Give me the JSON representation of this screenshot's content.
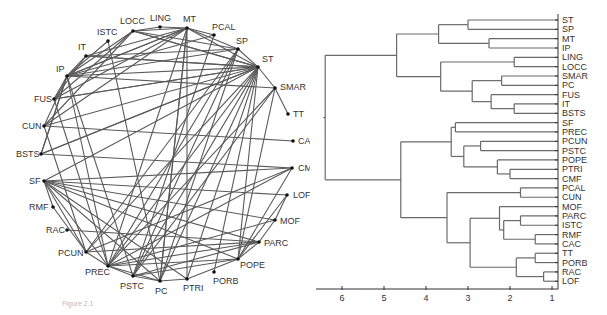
{
  "figure": {
    "caption": "Figure 2.1"
  },
  "network": {
    "nodes": [
      {
        "id": "LOCC",
        "x": 133,
        "y": 31,
        "lx": 120,
        "ly": 24
      },
      {
        "id": "LING",
        "x": 160,
        "y": 27,
        "lx": 150,
        "ly": 21
      },
      {
        "id": "MT",
        "x": 187,
        "y": 28,
        "lx": 183,
        "ly": 22
      },
      {
        "id": "PCAL",
        "x": 214,
        "y": 35,
        "lx": 212,
        "ly": 30
      },
      {
        "id": "ISTC",
        "x": 108,
        "y": 41,
        "lx": 97,
        "ly": 35
      },
      {
        "id": "IT",
        "x": 86,
        "y": 56,
        "lx": 78,
        "ly": 50
      },
      {
        "id": "SP",
        "x": 238,
        "y": 49,
        "lx": 236,
        "ly": 44
      },
      {
        "id": "ST",
        "x": 258,
        "y": 67,
        "lx": 262,
        "ly": 62
      },
      {
        "id": "IP",
        "x": 67,
        "y": 76,
        "lx": 56,
        "ly": 72
      },
      {
        "id": "SMAR",
        "x": 275,
        "y": 88,
        "lx": 280,
        "ly": 90
      },
      {
        "id": "FUS",
        "x": 54,
        "y": 99,
        "lx": 34,
        "ly": 102
      },
      {
        "id": "TT",
        "x": 288,
        "y": 114,
        "lx": 293,
        "ly": 117
      },
      {
        "id": "CUN",
        "x": 44,
        "y": 126,
        "lx": 22,
        "ly": 129
      },
      {
        "id": "CAC",
        "x": 293,
        "y": 141,
        "lx": 298,
        "ly": 144
      },
      {
        "id": "BSTS",
        "x": 41,
        "y": 154,
        "lx": 16,
        "ly": 157
      },
      {
        "id": "CMF",
        "x": 292,
        "y": 168,
        "lx": 298,
        "ly": 171
      },
      {
        "id": "SF",
        "x": 44,
        "y": 181,
        "lx": 29,
        "ly": 184
      },
      {
        "id": "LOF",
        "x": 287,
        "y": 195,
        "lx": 293,
        "ly": 198
      },
      {
        "id": "RMF",
        "x": 53,
        "y": 207,
        "lx": 29,
        "ly": 210
      },
      {
        "id": "MOF",
        "x": 275,
        "y": 220,
        "lx": 280,
        "ly": 224
      },
      {
        "id": "RAC",
        "x": 67,
        "y": 230,
        "lx": 46,
        "ly": 233
      },
      {
        "id": "PARC",
        "x": 259,
        "y": 242,
        "lx": 264,
        "ly": 246
      },
      {
        "id": "PCUN",
        "x": 86,
        "y": 252,
        "lx": 58,
        "ly": 256
      },
      {
        "id": "POPE",
        "x": 238,
        "y": 259,
        "lx": 240,
        "ly": 268
      },
      {
        "id": "PREC",
        "x": 108,
        "y": 266,
        "lx": 85,
        "ly": 275
      },
      {
        "id": "PORB",
        "x": 214,
        "y": 272,
        "lx": 213,
        "ly": 284
      },
      {
        "id": "PSTC",
        "x": 133,
        "y": 276,
        "lx": 120,
        "ly": 289
      },
      {
        "id": "PTRI",
        "x": 187,
        "y": 279,
        "lx": 183,
        "ly": 291
      },
      {
        "id": "PC",
        "x": 160,
        "y": 281,
        "lx": 155,
        "ly": 294
      }
    ],
    "edges": [
      [
        "LOCC",
        "LING"
      ],
      [
        "LOCC",
        "MT"
      ],
      [
        "LOCC",
        "SP"
      ],
      [
        "LOCC",
        "ST"
      ],
      [
        "LING",
        "MT"
      ],
      [
        "MT",
        "PCAL"
      ],
      [
        "MT",
        "SP"
      ],
      [
        "MT",
        "ST"
      ],
      [
        "MT",
        "IP"
      ],
      [
        "MT",
        "IT"
      ],
      [
        "MT",
        "FUS"
      ],
      [
        "MT",
        "PC"
      ],
      [
        "MT",
        "PTRI"
      ],
      [
        "MT",
        "PREC"
      ],
      [
        "PCAL",
        "IP"
      ],
      [
        "PCAL",
        "PSTC"
      ],
      [
        "SP",
        "ST"
      ],
      [
        "SP",
        "IP"
      ],
      [
        "SP",
        "IT"
      ],
      [
        "SP",
        "PREC"
      ],
      [
        "SP",
        "PC"
      ],
      [
        "SP",
        "PSTC"
      ],
      [
        "SP",
        "PCUN"
      ],
      [
        "ST",
        "SMAR"
      ],
      [
        "ST",
        "IP"
      ],
      [
        "ST",
        "FUS"
      ],
      [
        "ST",
        "IT"
      ],
      [
        "ST",
        "CUN"
      ],
      [
        "ST",
        "BSTS"
      ],
      [
        "ST",
        "PREC"
      ],
      [
        "ST",
        "PC"
      ],
      [
        "ST",
        "PTRI"
      ],
      [
        "ST",
        "PSTC"
      ],
      [
        "ST",
        "POPE"
      ],
      [
        "ST",
        "PORB"
      ],
      [
        "ST",
        "PCUN"
      ],
      [
        "ST",
        "LOCC"
      ],
      [
        "SMAR",
        "TT"
      ],
      [
        "SMAR",
        "IP"
      ],
      [
        "SMAR",
        "PREC"
      ],
      [
        "SMAR",
        "PSTC"
      ],
      [
        "SMAR",
        "POPE"
      ],
      [
        "ISTC",
        "PC"
      ],
      [
        "ISTC",
        "IP"
      ],
      [
        "IT",
        "FUS"
      ],
      [
        "IT",
        "IP"
      ],
      [
        "IT",
        "ST"
      ],
      [
        "IP",
        "FUS"
      ],
      [
        "IP",
        "CUN"
      ],
      [
        "IP",
        "BSTS"
      ],
      [
        "IP",
        "PREC"
      ],
      [
        "IP",
        "PSTC"
      ],
      [
        "IP",
        "LOCC"
      ],
      [
        "IP",
        "MT"
      ],
      [
        "FUS",
        "LOCC"
      ],
      [
        "FUS",
        "ST"
      ],
      [
        "FUS",
        "PREC"
      ],
      [
        "CUN",
        "CAC"
      ],
      [
        "CUN",
        "LOCC"
      ],
      [
        "CUN",
        "PCUN"
      ],
      [
        "CUN",
        "MT"
      ],
      [
        "BSTS",
        "CMF"
      ],
      [
        "BSTS",
        "ST"
      ],
      [
        "BSTS",
        "IP"
      ],
      [
        "SF",
        "CMF"
      ],
      [
        "SF",
        "MOF"
      ],
      [
        "SF",
        "PARC"
      ],
      [
        "SF",
        "POPE"
      ],
      [
        "SF",
        "PCUN"
      ],
      [
        "SF",
        "PREC"
      ],
      [
        "SF",
        "RMF"
      ],
      [
        "SF",
        "PC"
      ],
      [
        "SF",
        "PTRI"
      ],
      [
        "SF",
        "ST"
      ],
      [
        "SF",
        "LOF"
      ],
      [
        "CMF",
        "PREC"
      ],
      [
        "CMF",
        "PCUN"
      ],
      [
        "CMF",
        "POPE"
      ],
      [
        "LOF",
        "MOF"
      ],
      [
        "LOF",
        "POPE"
      ],
      [
        "MOF",
        "PREC"
      ],
      [
        "MOF",
        "PARC"
      ],
      [
        "RAC",
        "PARC"
      ],
      [
        "RMF",
        "PCUN"
      ],
      [
        "PARC",
        "PREC"
      ],
      [
        "PARC",
        "PCUN"
      ],
      [
        "PARC",
        "PSTC"
      ],
      [
        "PARC",
        "POPE"
      ],
      [
        "PCUN",
        "PREC"
      ],
      [
        "POPE",
        "PREC"
      ],
      [
        "POPE",
        "PTRI"
      ],
      [
        "POPE",
        "PSTC"
      ],
      [
        "PREC",
        "PSTC"
      ],
      [
        "PREC",
        "PC"
      ],
      [
        "PSTC",
        "PC"
      ],
      [
        "PC",
        "PTRI"
      ],
      [
        "PC",
        "MT"
      ]
    ]
  },
  "chart_data": {
    "type": "dendrogram",
    "title": "",
    "xlabel": "",
    "ylabel": "",
    "xlim": [
      0.8,
      6.6
    ],
    "x_ticks": [
      6,
      5,
      4,
      3,
      2,
      1
    ],
    "leaves": [
      "ST",
      "SP",
      "MT",
      "IP",
      "LING",
      "LOCC",
      "SMAR",
      "PC",
      "FUS",
      "IT",
      "BSTS",
      "SF",
      "PREC",
      "PCUN",
      "PSTC",
      "POPE",
      "PTRI",
      "CMF",
      "PCAL",
      "CUN",
      "MOF",
      "PARC",
      "ISTC",
      "RMF",
      "CAC",
      "TT",
      "PORB",
      "RAC",
      "LOF"
    ],
    "merges": [
      {
        "children": [
          "MT",
          "IP"
        ],
        "height": 2.5
      },
      {
        "children": [
          "ST",
          "SP"
        ],
        "height": 3.0
      },
      {
        "children": [
          "ST+SP",
          "MT+IP"
        ],
        "height": 3.7
      },
      {
        "children": [
          "LING",
          "LOCC"
        ],
        "height": 1.9
      },
      {
        "children": [
          "SMAR",
          "PC"
        ],
        "height": 2.2
      },
      {
        "children": [
          "IT",
          "BSTS"
        ],
        "height": 1.9
      },
      {
        "children": [
          "FUS",
          "IT+BSTS"
        ],
        "height": 2.45
      },
      {
        "children": [
          "SMAR+PC",
          "FUS+IT+BSTS"
        ],
        "height": 2.9
      },
      {
        "children": [
          "LING+LOCC",
          "SMAR..BSTS"
        ],
        "height": 3.65
      },
      {
        "children": [
          "top4",
          "occ-temporal"
        ],
        "height": 4.7
      },
      {
        "children": [
          "SF",
          "PREC"
        ],
        "height": 3.3
      },
      {
        "children": [
          "PCUN",
          "PSTC"
        ],
        "height": 2.7
      },
      {
        "children": [
          "PTRI",
          "CMF"
        ],
        "height": 2.0
      },
      {
        "children": [
          "POPE",
          "PTRI+CMF"
        ],
        "height": 2.3
      },
      {
        "children": [
          "PCUN+PSTC",
          "POPE+PTRI+CMF"
        ],
        "height": 3.1
      },
      {
        "children": [
          "SF+PREC",
          "PCUN..CMF"
        ],
        "height": 3.4
      },
      {
        "children": [
          "PCAL",
          "CUN"
        ],
        "height": 1.75
      },
      {
        "children": [
          "PARC",
          "ISTC"
        ],
        "height": 1.75
      },
      {
        "children": [
          "RMF",
          "CAC"
        ],
        "height": 1.4
      },
      {
        "children": [
          "PARC+ISTC",
          "RMF+CAC"
        ],
        "height": 2.15
      },
      {
        "children": [
          "MOF",
          "PARC..CAC"
        ],
        "height": 2.25
      },
      {
        "children": [
          "TT",
          "PORB"
        ],
        "height": 1.4
      },
      {
        "children": [
          "RAC",
          "LOF"
        ],
        "height": 1.2
      },
      {
        "children": [
          "TT+PORB",
          "RAC+LOF"
        ],
        "height": 1.85
      },
      {
        "children": [
          "MOF..CAC",
          "TT..LOF"
        ],
        "height": 2.95
      },
      {
        "children": [
          "PCAL+CUN",
          "MOF..LOF"
        ],
        "height": 3.5
      },
      {
        "children": [
          "SF..CMF",
          "PCAL..LOF"
        ],
        "height": 4.6
      },
      {
        "children": [
          "upper",
          "lower"
        ],
        "height": 6.4
      }
    ]
  }
}
